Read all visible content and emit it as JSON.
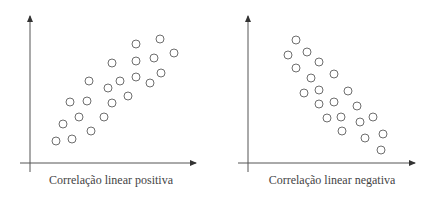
{
  "chart_data": [
    {
      "type": "scatter",
      "title": "Correlação linear positiva",
      "xlabel": "",
      "ylabel": "",
      "grid": false,
      "axis_origin_px": [
        30,
        163
      ],
      "points_px": [
        [
          56,
          141
        ],
        [
          72,
          139
        ],
        [
          63,
          124
        ],
        [
          79,
          117
        ],
        [
          91,
          131
        ],
        [
          70,
          102
        ],
        [
          87,
          101
        ],
        [
          104,
          117
        ],
        [
          89,
          81
        ],
        [
          112,
          103
        ],
        [
          108,
          88
        ],
        [
          120,
          81
        ],
        [
          128,
          96
        ],
        [
          112,
          63
        ],
        [
          136,
          44
        ],
        [
          136,
          61
        ],
        [
          136,
          77
        ],
        [
          154,
          58
        ],
        [
          160,
          39
        ],
        [
          174,
          53
        ],
        [
          150,
          83
        ],
        [
          161,
          73
        ]
      ]
    },
    {
      "type": "scatter",
      "title": "Correlação linear negativa",
      "xlabel": "",
      "ylabel": "",
      "grid": false,
      "axis_origin_px": [
        248,
        163
      ],
      "points_px": [
        [
          296,
          40
        ],
        [
          288,
          55
        ],
        [
          307,
          52
        ],
        [
          296,
          68
        ],
        [
          319,
          62
        ],
        [
          311,
          78
        ],
        [
          334,
          74
        ],
        [
          304,
          93
        ],
        [
          319,
          90
        ],
        [
          348,
          91
        ],
        [
          319,
          104
        ],
        [
          334,
          102
        ],
        [
          357,
          106
        ],
        [
          327,
          118
        ],
        [
          341,
          117
        ],
        [
          360,
          122
        ],
        [
          373,
          117
        ],
        [
          342,
          131
        ],
        [
          365,
          138
        ],
        [
          383,
          134
        ],
        [
          381,
          150
        ]
      ]
    }
  ],
  "captions": {
    "left": "Correlação linear positiva",
    "right": "Correlação linear negativa"
  },
  "colors": {
    "point_stroke": "#6e6e6e",
    "axis": "#555555",
    "text": "#444444"
  }
}
